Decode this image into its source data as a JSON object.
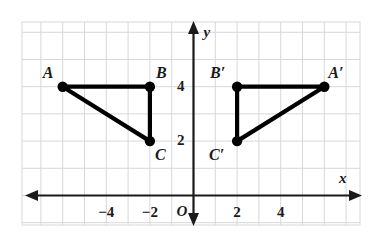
{
  "figure": {
    "type": "coordinate-plane-reflection",
    "background_color": "#ffffff",
    "grid_color": "#d8d8dc",
    "axis_color": "#1a1a1a",
    "shape_color": "#000000"
  },
  "axes": {
    "x_label": "x",
    "y_label": "y",
    "origin_label": "O",
    "x_ticks": [
      {
        "value": -4,
        "label": "−4"
      },
      {
        "value": -2,
        "label": "−2"
      },
      {
        "value": 2,
        "label": "2"
      },
      {
        "value": 4,
        "label": "4"
      }
    ],
    "y_ticks": [
      {
        "value": 2,
        "label": "2"
      },
      {
        "value": 4,
        "label": "4"
      }
    ],
    "x_range": [
      -7,
      8
    ],
    "y_range": [
      -1,
      7
    ],
    "grid": true,
    "grid_step": 1
  },
  "shapes": [
    {
      "name": "triangle-abc",
      "vertices": [
        {
          "label": "A",
          "x": -6,
          "y": 4
        },
        {
          "label": "B",
          "x": -2,
          "y": 4
        },
        {
          "label": "C",
          "x": -2,
          "y": 2
        }
      ],
      "label_offsets": [
        {
          "label": "A",
          "dx": -20,
          "dy": -22
        },
        {
          "label": "B",
          "dx": 6,
          "dy": -22
        },
        {
          "label": "C",
          "dx": 5,
          "dy": 6
        }
      ]
    },
    {
      "name": "triangle-a-prime-b-prime-c-prime",
      "vertices": [
        {
          "label": "B′",
          "x": 2,
          "y": 4
        },
        {
          "label": "A′",
          "x": 6,
          "y": 4
        },
        {
          "label": "C′",
          "x": 2,
          "y": 2
        }
      ],
      "label_offsets": [
        {
          "label": "B′",
          "dx": -27,
          "dy": -22
        },
        {
          "label": "A′",
          "dx": 4,
          "dy": -22
        },
        {
          "label": "C′",
          "dx": -28,
          "dy": 6
        }
      ]
    }
  ],
  "chart_data": {
    "type": "scatter",
    "title": "",
    "xlabel": "x",
    "ylabel": "y",
    "xlim": [
      -7,
      8
    ],
    "ylim": [
      -1,
      7
    ],
    "grid": true,
    "series": [
      {
        "name": "Triangle ABC",
        "points": [
          {
            "label": "A",
            "x": -6,
            "y": 4
          },
          {
            "label": "B",
            "x": -2,
            "y": 4
          },
          {
            "label": "C",
            "x": -2,
            "y": 2
          }
        ],
        "closed": true
      },
      {
        "name": "Triangle A'B'C'",
        "points": [
          {
            "label": "B'",
            "x": 2,
            "y": 4
          },
          {
            "label": "A'",
            "x": 6,
            "y": 4
          },
          {
            "label": "C'",
            "x": 2,
            "y": 2
          }
        ],
        "closed": true
      }
    ]
  }
}
